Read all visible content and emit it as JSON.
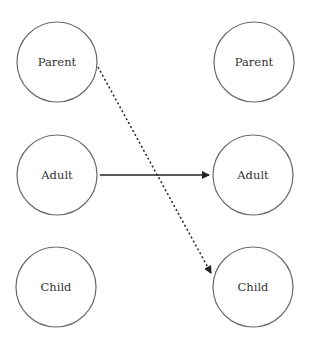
{
  "diagram": {
    "left_column": [
      {
        "id": "left-parent",
        "label": "Parent",
        "cx": 57,
        "cy": 62
      },
      {
        "id": "left-adult",
        "label": "Adult",
        "cx": 57,
        "cy": 175
      },
      {
        "id": "left-child",
        "label": "Child",
        "cx": 56,
        "cy": 287
      }
    ],
    "right_column": [
      {
        "id": "right-parent",
        "label": "Parent",
        "cx": 254,
        "cy": 62
      },
      {
        "id": "right-adult",
        "label": "Adult",
        "cx": 253,
        "cy": 175
      },
      {
        "id": "right-child",
        "label": "Child",
        "cx": 253,
        "cy": 287
      }
    ],
    "edges": [
      {
        "from": "left-adult",
        "to": "right-adult",
        "style": "solid"
      },
      {
        "from": "left-parent",
        "to": "right-child",
        "style": "dotted"
      }
    ],
    "colors": {
      "stroke": "#6a6a6a",
      "arrow": "#222222",
      "text": "#333333"
    }
  }
}
